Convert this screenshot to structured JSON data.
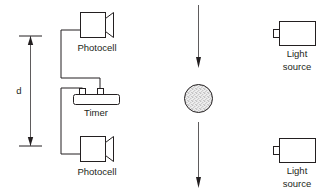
{
  "figure": {
    "background_color": "#ffffff",
    "line_color": "#231f20",
    "ball_fill_color": "#e6e6e6"
  },
  "dimension": {
    "label": "d",
    "name": "fall-distance"
  },
  "labels": {
    "photocell_top": "Photocell",
    "photocell_bottom": "Photocell",
    "timer": "Timer",
    "light_source_top_line1": "Light",
    "light_source_top_line2": "source",
    "light_source_bottom_line1": "Light",
    "light_source_bottom_line2": "source"
  },
  "components": {
    "photocell_top": {
      "name": "photocell-top",
      "shape": "box-with-horn"
    },
    "photocell_bottom": {
      "name": "photocell-bottom",
      "shape": "box-with-horn"
    },
    "timer": {
      "name": "timer",
      "shape": "rounded-box-with-terminals"
    },
    "light_source_top": {
      "name": "light-source-top",
      "shape": "box-with-tab"
    },
    "light_source_bottom": {
      "name": "light-source-bottom",
      "shape": "box-with-tab"
    },
    "falling_ball": {
      "name": "falling-ball",
      "shape": "stippled-circle"
    },
    "arrow_upper": {
      "name": "fall-direction-arrow-upper",
      "direction": "down"
    },
    "arrow_lower": {
      "name": "fall-direction-arrow-lower",
      "direction": "down"
    }
  }
}
